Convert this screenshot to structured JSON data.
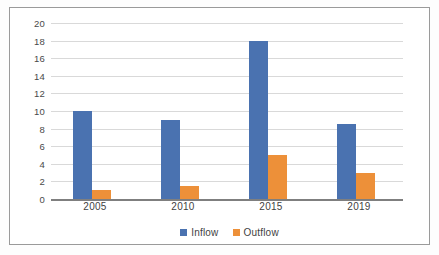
{
  "chart_data": {
    "type": "bar",
    "title": "",
    "subtitle": "",
    "xlabel": "",
    "ylabel": "",
    "categories": [
      "2005",
      "2010",
      "2015",
      "2019"
    ],
    "series": [
      {
        "name": "Inflow",
        "color": "#4a72b0",
        "values": [
          10,
          9,
          18,
          8.5
        ]
      },
      {
        "name": "Outflow",
        "color": "#ed9039",
        "values": [
          1,
          1.5,
          5,
          3
        ]
      }
    ],
    "ylim": [
      0,
      20
    ],
    "ytick_step": 2,
    "yticks": [
      "20",
      "18",
      "16",
      "14",
      "12",
      "10",
      "8",
      "6",
      "4",
      "2",
      "0"
    ],
    "grid": "horizontal",
    "legend_position": "bottom-center",
    "annotations": []
  },
  "legend": {
    "items": [
      {
        "label": "Inflow"
      },
      {
        "label": "Outflow"
      }
    ]
  },
  "colors": {
    "inflow": "#4a72b0",
    "outflow": "#ed9039",
    "gridline": "#d9d9d9",
    "axis": "#7f7f7f",
    "frame": "#9a9a9a",
    "text": "#3f3f3f"
  }
}
